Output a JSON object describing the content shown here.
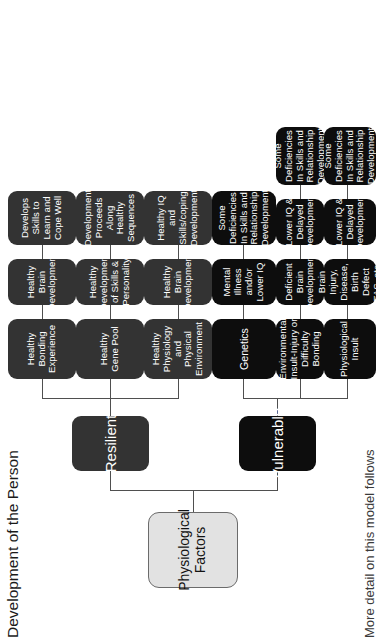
{
  "diagram": {
    "title": "Development of the Person",
    "footnote": "More detail on this model follows",
    "root": {
      "label": "Physiological Factors"
    },
    "branches": [
      {
        "id": "resilient",
        "label": "Resilient",
        "tone": "dark"
      },
      {
        "id": "vulnerable",
        "label": "Vulnerable",
        "tone": "black"
      }
    ],
    "colors": {
      "root_fill": "#e2e2e2",
      "root_border": "#6b6b6b",
      "resilient_fill": "#333333",
      "vulnerable_fill": "#0d0d0d",
      "node_text": "#ffffff",
      "connector": "#4f4f4f",
      "background": "#ffffff"
    },
    "rows": [
      {
        "branch": "resilient",
        "tone": "dark",
        "nodes": [
          "Healthy Bonding Experience",
          "Healthy Brain Development",
          "Develops Skills to Learn and Cope Well"
        ]
      },
      {
        "branch": "resilient",
        "tone": "dark",
        "nodes": [
          "Healthy Gene Pool",
          "Healthy Development of Skills & Personality",
          "Development Proceeds Along Healthy Sequences"
        ]
      },
      {
        "branch": "resilient",
        "tone": "dark",
        "nodes": [
          "Healthy Physiology and Physical Environment",
          "Healthy Brain Development",
          "Healthy IQ and Skills/coping Development"
        ]
      },
      {
        "branch": "vulnerable",
        "tone": "black",
        "nodes": [
          "Genetics",
          "Mental Illness and/or Lower IQ",
          "Some Deficiencies In Skills and Relationship Development"
        ]
      },
      {
        "branch": "vulnerable",
        "tone": "black",
        "nodes": [
          "Environmental Insult-Injury or Difficulty Bonding",
          "Deficient Brain Development",
          "Lower IQ & Delayed Development",
          "Some Deficiencies In Skills and Relationship Development"
        ]
      },
      {
        "branch": "vulnerable",
        "tone": "black",
        "nodes": [
          "Physiological Insult",
          "Brain Injury, Disease, Birth Defect FAS, etc.",
          "Lower IQ & Delayed Development",
          "Some Deficiencies In Skills and Relationship Development"
        ]
      }
    ]
  }
}
